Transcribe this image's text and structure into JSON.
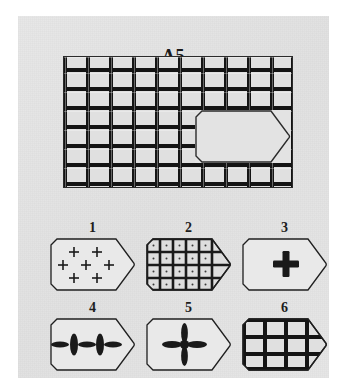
{
  "test_item": {
    "label": "A5",
    "type": "progressive-matrix-item"
  },
  "matrix": {
    "name": "main-pattern",
    "pattern": "lattice-grid",
    "columns": 10,
    "rows": 7,
    "missing_piece": {
      "shape": "pentagon-tag",
      "position": "lower-right",
      "fill_color": "#e3e3e3"
    },
    "line_color": "#141414",
    "background_color": "#e0e0e0"
  },
  "options": [
    {
      "number": "1",
      "name": "option-1",
      "content": "seven-small-plus-signs",
      "description": "scattered thin plus marks"
    },
    {
      "number": "2",
      "name": "option-2",
      "content": "fine-lattice-grid-with-dots",
      "description": "dense small grid, 5 by 4 cells"
    },
    {
      "number": "3",
      "name": "option-3",
      "content": "single-bold-cross",
      "description": "one thick straight-armed cross, centered"
    },
    {
      "number": "4",
      "name": "option-4",
      "content": "double-petal-cross",
      "description": "two joined crosses with elliptical arms"
    },
    {
      "number": "5",
      "name": "option-5",
      "content": "single-petal-cross",
      "description": "one cross with elliptical petal arms, centered"
    },
    {
      "number": "6",
      "name": "option-6",
      "content": "coarse-lattice-grid",
      "description": "thick 3 by 3 lattice matching the main pattern"
    }
  ],
  "colors": {
    "page_background": "#ffffff",
    "panel_background": "#e4e4e4",
    "ink": "#141414",
    "shape_fill": "#e3e3e3",
    "outline": "#2b2b2b"
  }
}
